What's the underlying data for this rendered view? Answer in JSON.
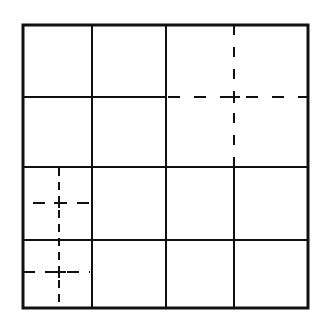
{
  "diagram": {
    "title": "",
    "grid": {
      "rows": 4,
      "cols": 4,
      "outer": {
        "x1": 23,
        "y1": 25,
        "x2": 308,
        "y2": 308
      },
      "vertical_lines_x": [
        92,
        166,
        234
      ],
      "horizontal_lines_y": [
        97,
        167,
        240
      ],
      "stroke_color": "#111111"
    },
    "crosshairs": [
      {
        "name": "top-right",
        "cx": 234,
        "cy": 97,
        "v": [
          25,
          167
        ],
        "h": [
          166,
          308
        ]
      },
      {
        "name": "bottom-left-upper",
        "cx": 59,
        "cy": 203,
        "v": [
          167,
          308
        ],
        "h": [
          33,
          90
        ]
      },
      {
        "name": "bottom-left-lower",
        "cx": 59,
        "cy": 272,
        "v": [
          167,
          308
        ],
        "h": [
          23,
          90
        ]
      }
    ]
  }
}
